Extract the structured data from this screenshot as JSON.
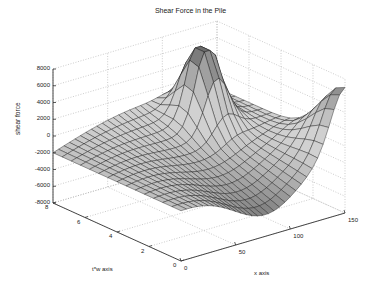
{
  "chart_data": {
    "type": "surface3d",
    "title": "Shear Force in the Pile",
    "xlabel": "x axis",
    "ylabel": "t*w axis",
    "zlabel": "shear force",
    "xlim": [
      0,
      150
    ],
    "ylim": [
      0,
      8
    ],
    "zlim": [
      -8000,
      8000
    ],
    "x_ticks": [
      "0",
      "50",
      "100",
      "150"
    ],
    "y_ticks": [
      "0",
      "2",
      "4",
      "6",
      "8"
    ],
    "z_ticks": [
      "8000",
      "6000",
      "4000",
      "2000",
      "0",
      "-2000",
      "-4000",
      "-6000",
      "-8000"
    ],
    "grid": true,
    "colormap": "gray",
    "surface_description": "Mesh surface; near-flat around -2000 at t*w=8; peaks near x=100..130 reaching ~8000 at t*w≈6 and ~5000 at t*w≈0 (x=150); trough ~-6000 along x≈60..100 at low t*w"
  }
}
